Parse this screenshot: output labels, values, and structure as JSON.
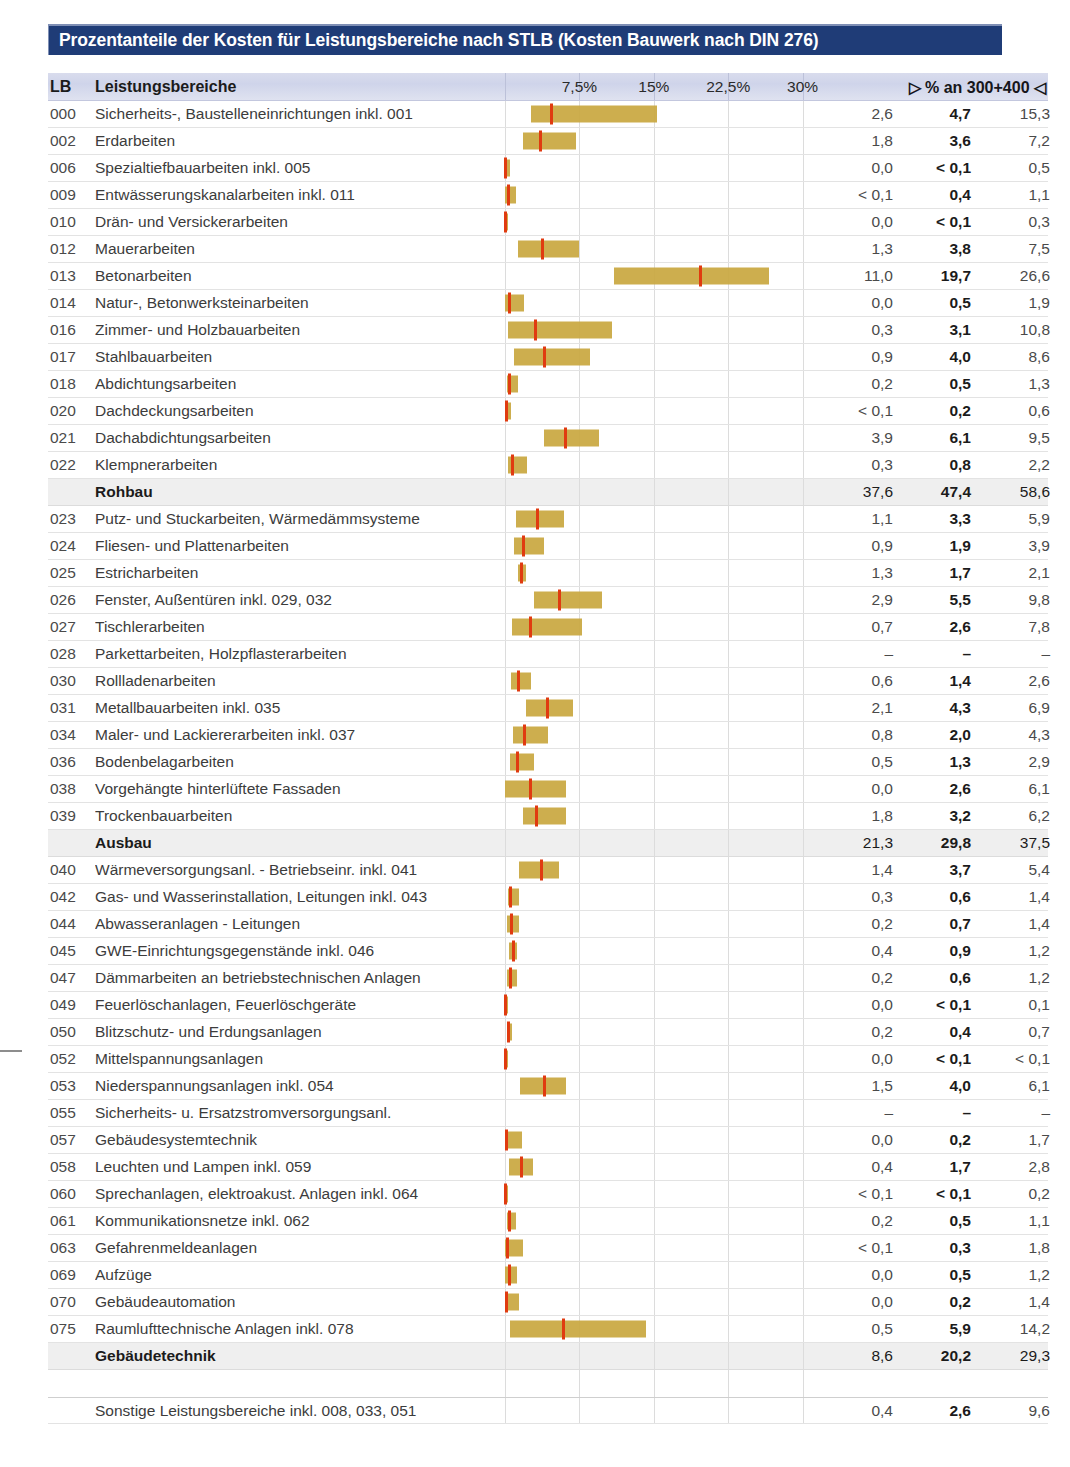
{
  "title": "Prozentanteile der Kosten für Leistungsbereiche nach STLB (Kosten Bauwerk nach DIN 276)",
  "header": {
    "lb": "LB",
    "name": "Leistungsbereiche",
    "numbers_label": "▷ % an 300+400 ◁",
    "ticks": [
      {
        "label": "7,5%",
        "value": 7.5
      },
      {
        "label": "15%",
        "value": 15
      },
      {
        "label": "22,5%",
        "value": 22.5
      },
      {
        "label": "30%",
        "value": 30
      }
    ]
  },
  "chart_data": {
    "type": "bar",
    "title": "Prozentanteile der Kosten für Leistungsbereiche nach STLB (Kosten Bauwerk nach DIN 276)",
    "xlabel": "% an 300+400",
    "ylabel": "Leistungsbereiche",
    "xlim": [
      0,
      33
    ],
    "grid": true,
    "xticks": [
      7.5,
      15,
      22.5,
      30
    ],
    "xticklabels": [
      "7,5%",
      "15%",
      "22,5%",
      "30%"
    ],
    "series": [
      {
        "name": "min",
        "note": "linke Spalte - unterer Wert"
      },
      {
        "name": "median",
        "note": "mittlere Spalte - fett, roter Marker"
      },
      {
        "name": "max",
        "note": "rechte Spalte - oberer Wert"
      }
    ],
    "rows": [
      {
        "lb": "000",
        "name": "Sicherheits-, Baustelleneinrichtungen inkl. 001",
        "min": 2.6,
        "median": 4.7,
        "max": 15.3,
        "min_text": "2,6",
        "median_text": "4,7",
        "max_text": "15,3",
        "kind": "item"
      },
      {
        "lb": "002",
        "name": "Erdarbeiten",
        "min": 1.8,
        "median": 3.6,
        "max": 7.2,
        "min_text": "1,8",
        "median_text": "3,6",
        "max_text": "7,2",
        "kind": "item"
      },
      {
        "lb": "006",
        "name": "Spezialtiefbauarbeiten inkl. 005",
        "min": 0.0,
        "median": 0.05,
        "max": 0.5,
        "min_text": "0,0",
        "median_text": "< 0,1",
        "max_text": "0,5",
        "kind": "item"
      },
      {
        "lb": "009",
        "name": "Entwässerungskanalarbeiten inkl. 011",
        "min": 0.05,
        "median": 0.4,
        "max": 1.1,
        "min_text": "< 0,1",
        "median_text": "0,4",
        "max_text": "1,1",
        "kind": "item"
      },
      {
        "lb": "010",
        "name": "Drän- und Versickerarbeiten",
        "min": 0.0,
        "median": 0.05,
        "max": 0.3,
        "min_text": "0,0",
        "median_text": "< 0,1",
        "max_text": "0,3",
        "kind": "item"
      },
      {
        "lb": "012",
        "name": "Mauerarbeiten",
        "min": 1.3,
        "median": 3.8,
        "max": 7.5,
        "min_text": "1,3",
        "median_text": "3,8",
        "max_text": "7,5",
        "kind": "item"
      },
      {
        "lb": "013",
        "name": "Betonarbeiten",
        "min": 11.0,
        "median": 19.7,
        "max": 26.6,
        "min_text": "11,0",
        "median_text": "19,7",
        "max_text": "26,6",
        "kind": "item"
      },
      {
        "lb": "014",
        "name": "Natur-, Betonwerksteinarbeiten",
        "min": 0.0,
        "median": 0.5,
        "max": 1.9,
        "min_text": "0,0",
        "median_text": "0,5",
        "max_text": "1,9",
        "kind": "item"
      },
      {
        "lb": "016",
        "name": "Zimmer- und Holzbauarbeiten",
        "min": 0.3,
        "median": 3.1,
        "max": 10.8,
        "min_text": "0,3",
        "median_text": "3,1",
        "max_text": "10,8",
        "kind": "item"
      },
      {
        "lb": "017",
        "name": "Stahlbauarbeiten",
        "min": 0.9,
        "median": 4.0,
        "max": 8.6,
        "min_text": "0,9",
        "median_text": "4,0",
        "max_text": "8,6",
        "kind": "item"
      },
      {
        "lb": "018",
        "name": "Abdichtungsarbeiten",
        "min": 0.2,
        "median": 0.5,
        "max": 1.3,
        "min_text": "0,2",
        "median_text": "0,5",
        "max_text": "1,3",
        "kind": "item"
      },
      {
        "lb": "020",
        "name": "Dachdeckungsarbeiten",
        "min": 0.05,
        "median": 0.2,
        "max": 0.6,
        "min_text": "< 0,1",
        "median_text": "0,2",
        "max_text": "0,6",
        "kind": "item"
      },
      {
        "lb": "021",
        "name": "Dachabdichtungsarbeiten",
        "min": 3.9,
        "median": 6.1,
        "max": 9.5,
        "min_text": "3,9",
        "median_text": "6,1",
        "max_text": "9,5",
        "kind": "item"
      },
      {
        "lb": "022",
        "name": "Klempnerarbeiten",
        "min": 0.3,
        "median": 0.8,
        "max": 2.2,
        "min_text": "0,3",
        "median_text": "0,8",
        "max_text": "2,2",
        "kind": "item"
      },
      {
        "lb": "",
        "name": "Rohbau",
        "min": 37.6,
        "median": 47.4,
        "max": 58.6,
        "min_text": "37,6",
        "median_text": "47,4",
        "max_text": "58,6",
        "kind": "summary"
      },
      {
        "lb": "023",
        "name": "Putz- und Stuckarbeiten, Wärmedämmsysteme",
        "min": 1.1,
        "median": 3.3,
        "max": 5.9,
        "min_text": "1,1",
        "median_text": "3,3",
        "max_text": "5,9",
        "kind": "item"
      },
      {
        "lb": "024",
        "name": "Fliesen- und Plattenarbeiten",
        "min": 0.9,
        "median": 1.9,
        "max": 3.9,
        "min_text": "0,9",
        "median_text": "1,9",
        "max_text": "3,9",
        "kind": "item"
      },
      {
        "lb": "025",
        "name": "Estricharbeiten",
        "min": 1.3,
        "median": 1.7,
        "max": 2.1,
        "min_text": "1,3",
        "median_text": "1,7",
        "max_text": "2,1",
        "kind": "item"
      },
      {
        "lb": "026",
        "name": "Fenster, Außentüren inkl. 029, 032",
        "min": 2.9,
        "median": 5.5,
        "max": 9.8,
        "min_text": "2,9",
        "median_text": "5,5",
        "max_text": "9,8",
        "kind": "item"
      },
      {
        "lb": "027",
        "name": "Tischlerarbeiten",
        "min": 0.7,
        "median": 2.6,
        "max": 7.8,
        "min_text": "0,7",
        "median_text": "2,6",
        "max_text": "7,8",
        "kind": "item"
      },
      {
        "lb": "028",
        "name": "Parkettarbeiten, Holzpflasterarbeiten",
        "min": null,
        "median": null,
        "max": null,
        "min_text": "–",
        "median_text": "–",
        "max_text": "–",
        "kind": "item"
      },
      {
        "lb": "030",
        "name": "Rollladenarbeiten",
        "min": 0.6,
        "median": 1.4,
        "max": 2.6,
        "min_text": "0,6",
        "median_text": "1,4",
        "max_text": "2,6",
        "kind": "item"
      },
      {
        "lb": "031",
        "name": "Metallbauarbeiten inkl. 035",
        "min": 2.1,
        "median": 4.3,
        "max": 6.9,
        "min_text": "2,1",
        "median_text": "4,3",
        "max_text": "6,9",
        "kind": "item"
      },
      {
        "lb": "034",
        "name": "Maler- und Lackiererarbeiten inkl. 037",
        "min": 0.8,
        "median": 2.0,
        "max": 4.3,
        "min_text": "0,8",
        "median_text": "2,0",
        "max_text": "4,3",
        "kind": "item"
      },
      {
        "lb": "036",
        "name": "Bodenbelagarbeiten",
        "min": 0.5,
        "median": 1.3,
        "max": 2.9,
        "min_text": "0,5",
        "median_text": "1,3",
        "max_text": "2,9",
        "kind": "item"
      },
      {
        "lb": "038",
        "name": "Vorgehängte hinterlüftete Fassaden",
        "min": 0.0,
        "median": 2.6,
        "max": 6.1,
        "min_text": "0,0",
        "median_text": "2,6",
        "max_text": "6,1",
        "kind": "item"
      },
      {
        "lb": "039",
        "name": "Trockenbauarbeiten",
        "min": 1.8,
        "median": 3.2,
        "max": 6.2,
        "min_text": "1,8",
        "median_text": "3,2",
        "max_text": "6,2",
        "kind": "item"
      },
      {
        "lb": "",
        "name": "Ausbau",
        "min": 21.3,
        "median": 29.8,
        "max": 37.5,
        "min_text": "21,3",
        "median_text": "29,8",
        "max_text": "37,5",
        "kind": "summary"
      },
      {
        "lb": "040",
        "name": "Wärmeversorgungsanl. - Betriebseinr. inkl. 041",
        "min": 1.4,
        "median": 3.7,
        "max": 5.4,
        "min_text": "1,4",
        "median_text": "3,7",
        "max_text": "5,4",
        "kind": "item"
      },
      {
        "lb": "042",
        "name": "Gas- und Wasserinstallation, Leitungen inkl. 043",
        "min": 0.3,
        "median": 0.6,
        "max": 1.4,
        "min_text": "0,3",
        "median_text": "0,6",
        "max_text": "1,4",
        "kind": "item"
      },
      {
        "lb": "044",
        "name": "Abwasseranlagen - Leitungen",
        "min": 0.2,
        "median": 0.7,
        "max": 1.4,
        "min_text": "0,2",
        "median_text": "0,7",
        "max_text": "1,4",
        "kind": "item"
      },
      {
        "lb": "045",
        "name": "GWE-Einrichtungsgegenstände inkl. 046",
        "min": 0.4,
        "median": 0.9,
        "max": 1.2,
        "min_text": "0,4",
        "median_text": "0,9",
        "max_text": "1,2",
        "kind": "item"
      },
      {
        "lb": "047",
        "name": "Dämmarbeiten an betriebstechnischen Anlagen",
        "min": 0.2,
        "median": 0.6,
        "max": 1.2,
        "min_text": "0,2",
        "median_text": "0,6",
        "max_text": "1,2",
        "kind": "item"
      },
      {
        "lb": "049",
        "name": "Feuerlöschanlagen, Feuerlöschgeräte",
        "min": 0.0,
        "median": 0.05,
        "max": 0.1,
        "min_text": "0,0",
        "median_text": "< 0,1",
        "max_text": "0,1",
        "kind": "item"
      },
      {
        "lb": "050",
        "name": "Blitzschutz- und Erdungsanlagen",
        "min": 0.2,
        "median": 0.4,
        "max": 0.7,
        "min_text": "0,2",
        "median_text": "0,4",
        "max_text": "0,7",
        "kind": "item"
      },
      {
        "lb": "052",
        "name": "Mittelspannungsanlagen",
        "min": 0.0,
        "median": 0.05,
        "max": 0.05,
        "min_text": "0,0",
        "median_text": "< 0,1",
        "max_text": "< 0,1",
        "kind": "item"
      },
      {
        "lb": "053",
        "name": "Niederspannungsanlagen inkl. 054",
        "min": 1.5,
        "median": 4.0,
        "max": 6.1,
        "min_text": "1,5",
        "median_text": "4,0",
        "max_text": "6,1",
        "kind": "item"
      },
      {
        "lb": "055",
        "name": "Sicherheits- u. Ersatzstromversorgungsanl.",
        "min": null,
        "median": null,
        "max": null,
        "min_text": "–",
        "median_text": "–",
        "max_text": "–",
        "kind": "item"
      },
      {
        "lb": "057",
        "name": "Gebäudesystemtechnik",
        "min": 0.0,
        "median": 0.2,
        "max": 1.7,
        "min_text": "0,0",
        "median_text": "0,2",
        "max_text": "1,7",
        "kind": "item"
      },
      {
        "lb": "058",
        "name": "Leuchten und Lampen inkl. 059",
        "min": 0.4,
        "median": 1.7,
        "max": 2.8,
        "min_text": "0,4",
        "median_text": "1,7",
        "max_text": "2,8",
        "kind": "item"
      },
      {
        "lb": "060",
        "name": "Sprechanlagen, elektroakust. Anlagen inkl. 064",
        "min": 0.05,
        "median": 0.05,
        "max": 0.2,
        "min_text": "< 0,1",
        "median_text": "< 0,1",
        "max_text": "0,2",
        "kind": "item"
      },
      {
        "lb": "061",
        "name": "Kommunikationsnetze inkl. 062",
        "min": 0.2,
        "median": 0.5,
        "max": 1.1,
        "min_text": "0,2",
        "median_text": "0,5",
        "max_text": "1,1",
        "kind": "item"
      },
      {
        "lb": "063",
        "name": "Gefahrenmeldeanlagen",
        "min": 0.05,
        "median": 0.3,
        "max": 1.8,
        "min_text": "< 0,1",
        "median_text": "0,3",
        "max_text": "1,8",
        "kind": "item"
      },
      {
        "lb": "069",
        "name": "Aufzüge",
        "min": 0.0,
        "median": 0.5,
        "max": 1.2,
        "min_text": "0,0",
        "median_text": "0,5",
        "max_text": "1,2",
        "kind": "item"
      },
      {
        "lb": "070",
        "name": "Gebäudeautomation",
        "min": 0.0,
        "median": 0.2,
        "max": 1.4,
        "min_text": "0,0",
        "median_text": "0,2",
        "max_text": "1,4",
        "kind": "item"
      },
      {
        "lb": "075",
        "name": "Raumlufttechnische Anlagen inkl. 078",
        "min": 0.5,
        "median": 5.9,
        "max": 14.2,
        "min_text": "0,5",
        "median_text": "5,9",
        "max_text": "14,2",
        "kind": "item"
      },
      {
        "lb": "",
        "name": "Gebäudetechnik",
        "min": 8.6,
        "median": 20.2,
        "max": 29.3,
        "min_text": "8,6",
        "median_text": "20,2",
        "max_text": "29,3",
        "kind": "summary"
      },
      {
        "lb": "",
        "name": "",
        "min": null,
        "median": null,
        "max": null,
        "min_text": "",
        "median_text": "",
        "max_text": "",
        "kind": "spacer"
      },
      {
        "lb": "",
        "name": "Sonstige Leistungsbereiche inkl. 008, 033, 051",
        "min": 0.4,
        "median": 2.6,
        "max": 9.6,
        "min_text": "0,4",
        "median_text": "2,6",
        "max_text": "9,6",
        "kind": "last"
      }
    ]
  },
  "colors": {
    "title_bar": "#1f3c77",
    "bar": "#c9a73f",
    "median_marker": "#e03b10",
    "header_row": "#d5d9ec",
    "summary_row": "#efefef"
  }
}
